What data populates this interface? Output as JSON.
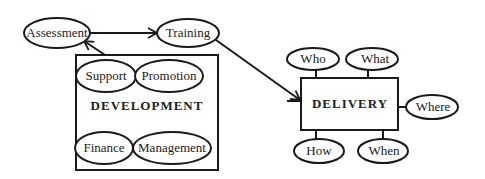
{
  "diagram": {
    "colors": {
      "stroke": "#1a1a1a",
      "text": "#222222",
      "background": "#ffffff"
    },
    "nodes": {
      "assessment": "Assessment",
      "training": "Training",
      "development": "DEVELOPMENT",
      "support": "Support",
      "promotion": "Promotion",
      "finance": "Finance",
      "management": "Management",
      "delivery": "DELIVERY",
      "who": "Who",
      "what": "What",
      "where": "Where",
      "how": "How",
      "when": "When"
    },
    "edges": [
      {
        "from": "Assessment",
        "to": "Training",
        "type": "arrow"
      },
      {
        "from": "DEVELOPMENT",
        "to": "Assessment",
        "type": "arrow"
      },
      {
        "from": "Training",
        "to": "DELIVERY",
        "type": "arrow"
      },
      {
        "from": "DELIVERY",
        "to": "Who",
        "type": "line"
      },
      {
        "from": "DELIVERY",
        "to": "What",
        "type": "line"
      },
      {
        "from": "DELIVERY",
        "to": "Where",
        "type": "line"
      },
      {
        "from": "DELIVERY",
        "to": "How",
        "type": "line"
      },
      {
        "from": "DELIVERY",
        "to": "When",
        "type": "line"
      }
    ]
  }
}
